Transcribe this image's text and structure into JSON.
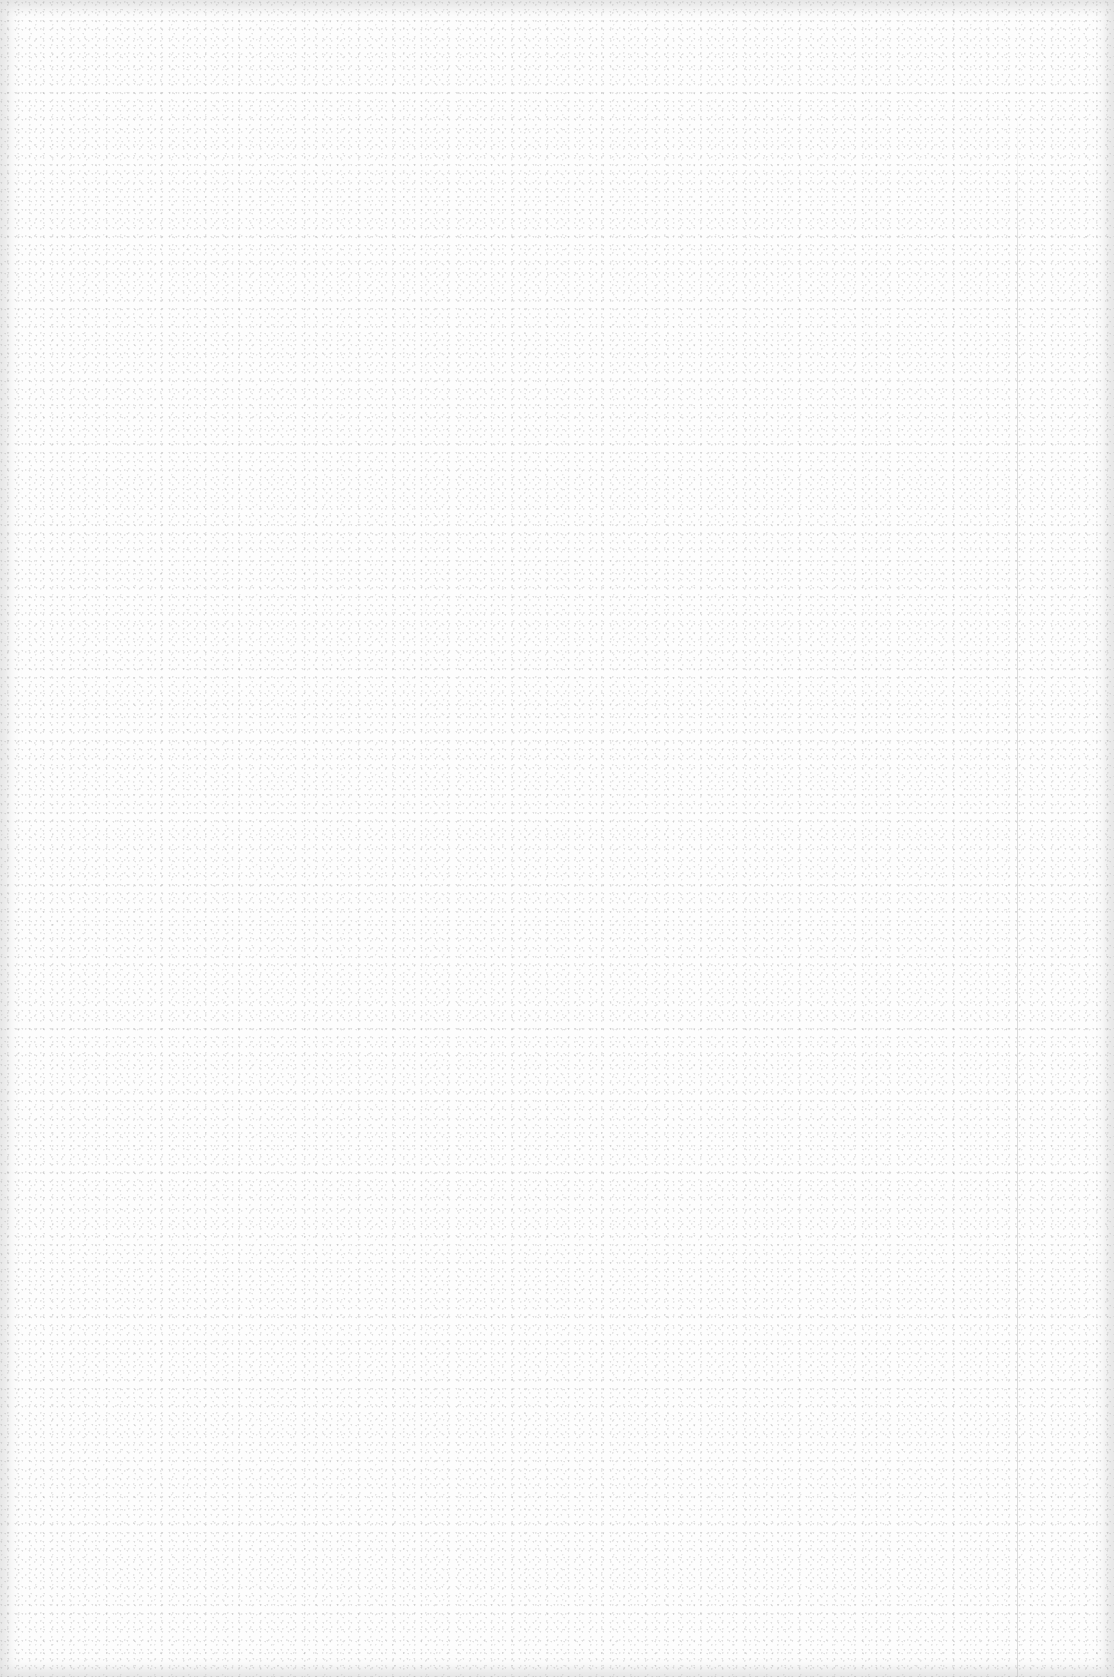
{
  "document": {
    "type": "blank-page",
    "content": [],
    "background_color": "#fdfdfd",
    "margin_line": {
      "present": true,
      "orientation": "vertical",
      "x": 1017
    }
  }
}
